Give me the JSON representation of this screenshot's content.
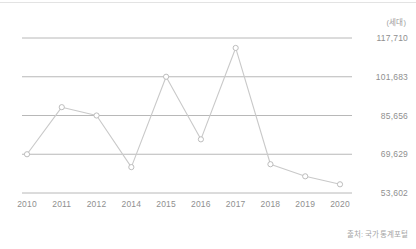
{
  "chart_data": {
    "type": "line",
    "title": "",
    "subtitle": "",
    "xlabel": "",
    "ylabel": "",
    "unit_label": "(세대)",
    "source": "출처: 국가통계포털",
    "grid": true,
    "legend": false,
    "legend_position": "none",
    "categories": [
      "2010",
      "2011",
      "2012",
      "2014",
      "2015",
      "2016",
      "2017",
      "2018",
      "2019",
      "2020"
    ],
    "values": [
      69629,
      89100,
      85656,
      64300,
      101683,
      75800,
      113600,
      65500,
      60500,
      57200
    ],
    "series": [
      {
        "name": "세대수",
        "values": [
          69629,
          89100,
          85656,
          64300,
          101683,
          75800,
          113600,
          65500,
          60500,
          57200
        ]
      }
    ],
    "ylim": [
      53602,
      117710
    ],
    "ytick_labels": [
      "117,710",
      "101,683",
      "85,656",
      "69,629",
      "53,602"
    ],
    "ytick_values": [
      117710,
      101683,
      85656,
      69629,
      53602
    ],
    "xtick_labels": [
      "2010",
      "2011",
      "2012",
      "2014",
      "2015",
      "2016",
      "2017",
      "2018",
      "2019",
      "2020"
    ],
    "colors": {
      "line": "#c9c9c9",
      "marker_stroke": "#b5b5b5",
      "marker_fill": "#ffffff",
      "grid": "#b0b0b0",
      "text": "#8f8f8f",
      "background": "#ffffff"
    }
  }
}
